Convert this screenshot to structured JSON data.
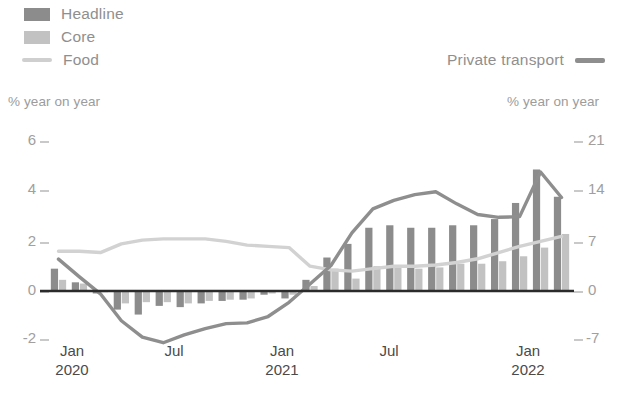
{
  "legend": {
    "items": [
      {
        "label": "Headline",
        "type": "bar",
        "color": "#8c8c8c",
        "name": "legend-item-headline"
      },
      {
        "label": "Core",
        "type": "bar",
        "color": "#c2c2c2",
        "name": "legend-item-core"
      },
      {
        "label": "Food",
        "type": "line",
        "color": "#cfcfcf",
        "name": "legend-item-food"
      }
    ],
    "right_item": {
      "label": "Private transport",
      "type": "line",
      "color": "#8e8e8e",
      "name": "legend-item-private-transport"
    }
  },
  "axes": {
    "left_title": "% year on year",
    "right_title": "% year on year",
    "left_ticks": [
      "6",
      "4",
      "2",
      "0",
      "-2"
    ],
    "right_ticks": [
      "21",
      "14",
      "7",
      "0",
      "-7"
    ],
    "x_labels": [
      {
        "month": "Jan",
        "year": "2020"
      },
      {
        "month": "Jul",
        "year": ""
      },
      {
        "month": "Jan",
        "year": "2021"
      },
      {
        "month": "Jul",
        "year": ""
      },
      {
        "month": "Jan",
        "year": "2022"
      }
    ]
  },
  "colors": {
    "headline": "#8c8c8c",
    "core": "#c2c2c2",
    "food": "#d2d2d2",
    "private_transport": "#8e8e8e",
    "zero_line": "#2b2b2b",
    "tick": "#c9c9c9",
    "text_muted": "#9a9a9a",
    "text_dark": "#4a4a4a"
  },
  "chart_data": {
    "type": "bar",
    "title": "",
    "xlabel": "",
    "ylabel": "% year on year",
    "y2label": "% year on year",
    "ylim": [
      -2.9,
      6.2
    ],
    "y2lim": [
      -10.15,
      21.7
    ],
    "yticks": [
      6,
      4,
      2,
      0,
      -2
    ],
    "y2ticks": [
      21,
      14,
      7,
      0,
      -7
    ],
    "grid": false,
    "legend_position": "top",
    "x": [
      "Jan 2020",
      "Feb 2020",
      "Mar 2020",
      "Apr 2020",
      "May 2020",
      "Jun 2020",
      "Jul 2020",
      "Aug 2020",
      "Sep 2020",
      "Oct 2020",
      "Nov 2020",
      "Dec 2020",
      "Jan 2021",
      "Feb 2021",
      "Mar 2021",
      "Apr 2021",
      "May 2021",
      "Jun 2021",
      "Jul 2021",
      "Aug 2021",
      "Sep 2021",
      "Oct 2021",
      "Nov 2021",
      "Dec 2021",
      "Jan 2022"
    ],
    "x_tick_positions": [
      0,
      6,
      12,
      18,
      24
    ],
    "series": [
      {
        "name": "Headline",
        "type": "bar",
        "axis": "left",
        "color": "#8c8c8c",
        "values": [
          0.9,
          0.35,
          -0.1,
          -0.75,
          -0.95,
          -0.6,
          -0.65,
          -0.5,
          -0.4,
          -0.35,
          -0.15,
          -0.3,
          0.45,
          1.35,
          1.9,
          2.55,
          2.65,
          2.55,
          2.55,
          2.65,
          2.65,
          2.9,
          3.55,
          4.9,
          3.8
        ]
      },
      {
        "name": "Core",
        "type": "bar",
        "axis": "left",
        "color": "#c2c2c2",
        "values": [
          0.45,
          0.3,
          -0.05,
          -0.5,
          -0.45,
          -0.45,
          -0.5,
          -0.4,
          -0.35,
          -0.3,
          -0.1,
          -0.15,
          0.2,
          0.9,
          0.5,
          1.0,
          1.0,
          0.9,
          0.95,
          1.1,
          1.1,
          1.2,
          1.4,
          1.75,
          2.3
        ]
      },
      {
        "name": "Food",
        "type": "line",
        "axis": "left",
        "color": "#d2d2d2",
        "values": [
          1.6,
          1.6,
          1.55,
          1.9,
          2.05,
          2.1,
          2.1,
          2.1,
          2.0,
          1.85,
          1.8,
          1.75,
          1.0,
          0.85,
          0.8,
          0.9,
          1.0,
          1.0,
          1.05,
          1.15,
          1.3,
          1.55,
          1.8,
          2.0,
          2.2
        ]
      },
      {
        "name": "Private transport",
        "type": "line",
        "axis": "right",
        "color": "#8e8e8e",
        "values": [
          4.5,
          2.0,
          -0.4,
          -4.2,
          -6.5,
          -7.3,
          -6.2,
          -5.3,
          -4.6,
          -4.5,
          -3.6,
          -1.6,
          1.0,
          3.6,
          8.2,
          11.6,
          12.8,
          13.6,
          14.0,
          12.3,
          10.8,
          10.4,
          10.5,
          16.8,
          13.2
        ]
      }
    ]
  }
}
